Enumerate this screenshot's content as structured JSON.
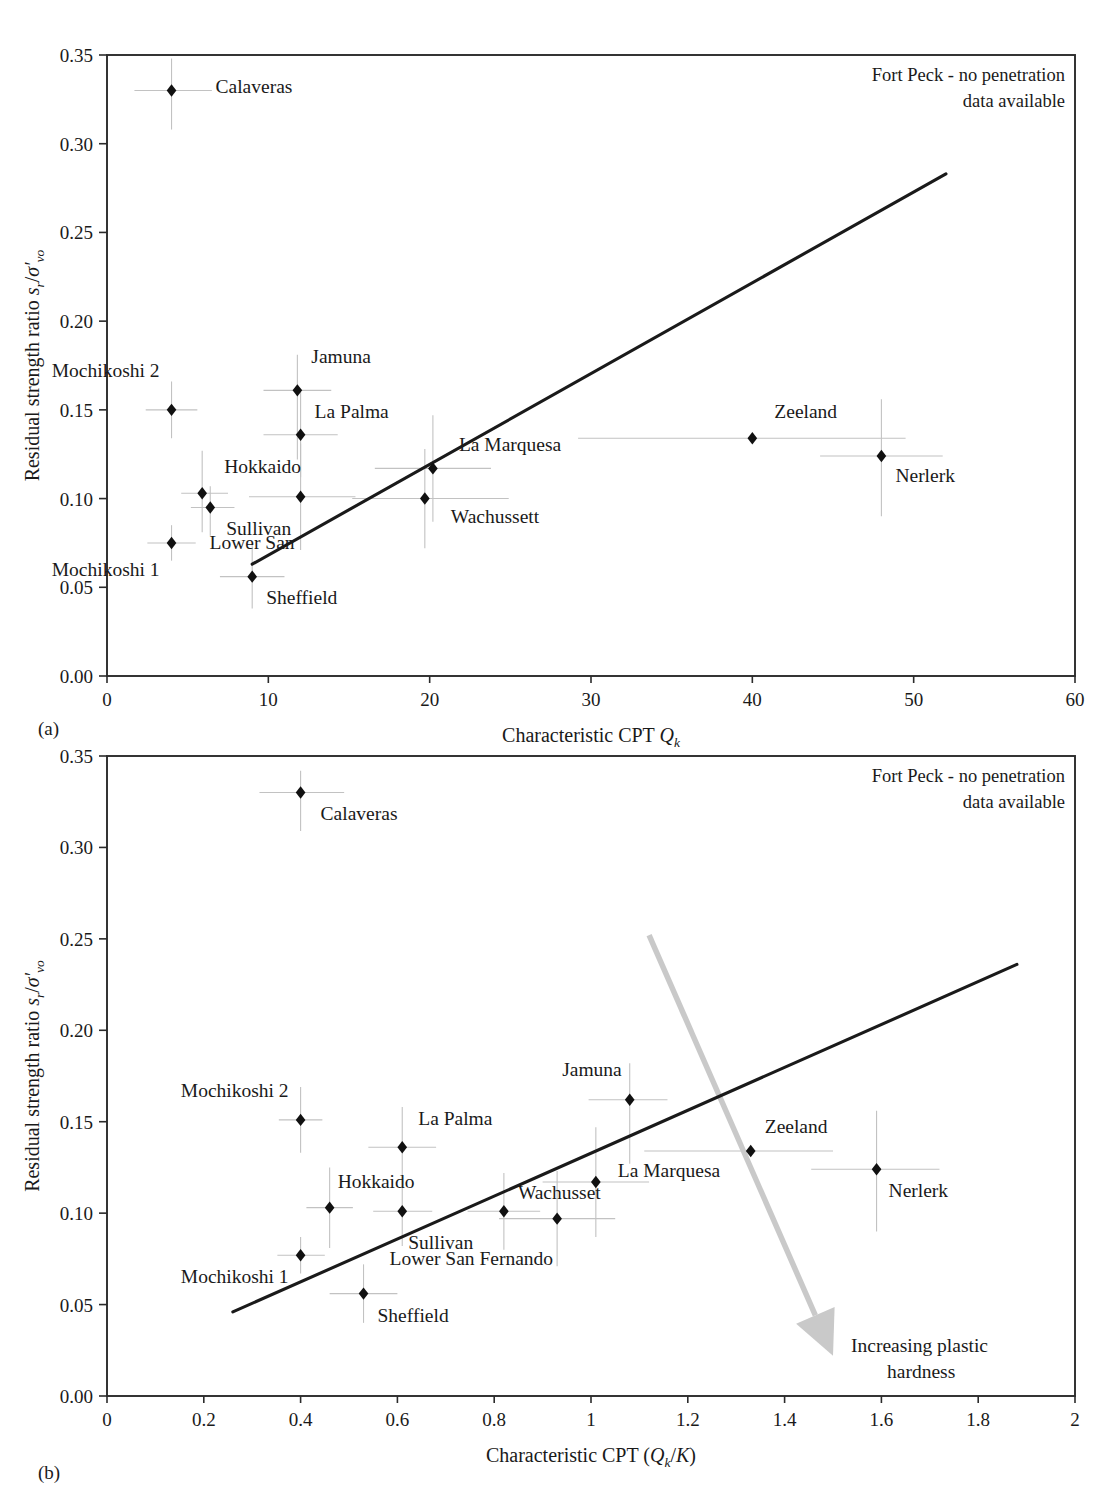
{
  "figure": {
    "panel_a_tag": "(a)",
    "panel_b_tag": "(b)"
  },
  "chart_data": [
    {
      "type": "scatter",
      "panel": "(a)",
      "title": "",
      "xlabel": "Characteristic CPT Q_k",
      "xlabel_parts": {
        "main": "Characteristic CPT ",
        "italic": "Q",
        "sub": "k"
      },
      "ylabel": "Residual strength ratio s_r/σ'_vo",
      "ylabel_parts": {
        "main": "Residual strength ratio ",
        "s": "s",
        "s_sub": "r",
        "slash": "/",
        "sigma": "σ′",
        "sigma_sub": "vo"
      },
      "xlim": [
        0,
        60
      ],
      "ylim": [
        0.0,
        0.35
      ],
      "xticks": [
        0,
        10,
        20,
        30,
        40,
        50,
        60
      ],
      "xticklabels": [
        "0",
        "10",
        "20",
        "30",
        "40",
        "50",
        "60"
      ],
      "yticks": [
        0.0,
        0.05,
        0.1,
        0.15,
        0.2,
        0.25,
        0.3,
        0.35
      ],
      "yticklabels": [
        "0.00",
        "0.05",
        "0.10",
        "0.15",
        "0.20",
        "0.25",
        "0.30",
        "0.35"
      ],
      "grid": false,
      "legend": "none",
      "annotation": "Fort Peck - no penetration data available",
      "annotation_lines": [
        "Fort Peck - no penetration",
        "data available"
      ],
      "trendline": {
        "x": [
          9.0,
          52.0
        ],
        "y": [
          0.063,
          0.283
        ]
      },
      "points": [
        {
          "label": "Calaveras",
          "x": 4.0,
          "y": 0.33,
          "xerr": [
            2.3,
            2.5
          ],
          "yerr": [
            0.022,
            0.018
          ],
          "label_dx": 44,
          "label_dy": 3
        },
        {
          "label": "Mochikoshi 2",
          "x": 4.0,
          "y": 0.15,
          "xerr": [
            1.6,
            1.6
          ],
          "yerr": [
            0.016,
            0.016
          ],
          "label_dx": -12,
          "label_dy": -33
        },
        {
          "label": "Jamuna",
          "x": 11.8,
          "y": 0.161,
          "xerr": [
            2.1,
            2.1
          ],
          "yerr": [
            0.039,
            0.02
          ],
          "label_dx": 14,
          "label_dy": -27
        },
        {
          "label": "La Palma",
          "x": 12.0,
          "y": 0.136,
          "xerr": [
            2.3,
            2.3
          ],
          "yerr": [
            0.024,
            0.024
          ],
          "label_dx": 14,
          "label_dy": -17
        },
        {
          "label": "La Marquesa",
          "x": 20.2,
          "y": 0.117,
          "xerr": [
            3.6,
            3.6
          ],
          "yerr": [
            0.03,
            0.03
          ],
          "label_dx": 26,
          "label_dy": -17
        },
        {
          "label": "Hokkaido",
          "x": 5.9,
          "y": 0.103,
          "xerr": [
            1.3,
            1.6
          ],
          "yerr": [
            0.022,
            0.024
          ],
          "label_dx": 22,
          "label_dy": -20
        },
        {
          "label": "Sullivan",
          "x": 6.4,
          "y": 0.095,
          "xerr": [
            1.2,
            1.5
          ],
          "yerr": [
            0.016,
            0.012
          ],
          "label_dx": 16,
          "label_dy": 28
        },
        {
          "label": "Lower San",
          "x": 12.0,
          "y": 0.101,
          "xerr": [
            3.2,
            3.4
          ],
          "yerr": [
            0.03,
            0.03
          ],
          "label_dx": -6,
          "label_dy": 52
        },
        {
          "label": "Wachussett",
          "x": 19.7,
          "y": 0.1,
          "xerr": [
            4.5,
            5.2
          ],
          "yerr": [
            0.028,
            0.028
          ],
          "label_dx": 26,
          "label_dy": 24
        },
        {
          "label": "Mochikoshi 1",
          "x": 4.0,
          "y": 0.075,
          "xerr": [
            1.5,
            1.5
          ],
          "yerr": [
            0.01,
            0.01
          ],
          "label_dx": -12,
          "label_dy": 33
        },
        {
          "label": "Sheffield",
          "x": 9.0,
          "y": 0.056,
          "xerr": [
            2.0,
            2.0
          ],
          "yerr": [
            0.018,
            0.018
          ],
          "label_dx": 14,
          "label_dy": 27
        },
        {
          "label": "Zeeland",
          "x": 40.0,
          "y": 0.134,
          "xerr": [
            10.8,
            9.5
          ],
          "yerr": [
            0.0,
            0.0
          ],
          "label_dx": 22,
          "label_dy": -20
        },
        {
          "label": "Nerlerk",
          "x": 48.0,
          "y": 0.124,
          "xerr": [
            3.8,
            3.8
          ],
          "yerr": [
            0.034,
            0.032
          ],
          "label_dx": 14,
          "label_dy": 26
        }
      ]
    },
    {
      "type": "scatter",
      "panel": "(b)",
      "title": "",
      "xlabel": "Characteristic CPT (Q_k/K)",
      "xlabel_parts": {
        "main": "Characteristic CPT (",
        "italic": "Q",
        "sub": "k",
        "mid": "/",
        "italic2": "K",
        "close": ")"
      },
      "ylabel": "Residual strength ratio s_r/σ'_vo",
      "ylabel_parts": {
        "main": "Residual strength ratio ",
        "s": "s",
        "s_sub": "r",
        "slash": "/",
        "sigma": "σ′",
        "sigma_sub": "vo"
      },
      "xlim": [
        0,
        2
      ],
      "ylim": [
        0.0,
        0.35
      ],
      "xticks": [
        0,
        0.2,
        0.4,
        0.6,
        0.8,
        1.0,
        1.2,
        1.4,
        1.6,
        1.8,
        2.0
      ],
      "xticklabels": [
        "0",
        "0.2",
        "0.4",
        "0.6",
        "0.8",
        "1",
        "1.2",
        "1.4",
        "1.6",
        "1.8",
        "2"
      ],
      "yticks": [
        0.0,
        0.05,
        0.1,
        0.15,
        0.2,
        0.25,
        0.3,
        0.35
      ],
      "yticklabels": [
        "0.00",
        "0.05",
        "0.10",
        "0.15",
        "0.20",
        "0.25",
        "0.30",
        "0.35"
      ],
      "grid": false,
      "legend": "none",
      "annotation": "Fort Peck - no penetration data available",
      "annotation_lines": [
        "Fort Peck - no penetration",
        "data available"
      ],
      "trendline": {
        "x": [
          0.26,
          1.88
        ],
        "y": [
          0.046,
          0.236
        ]
      },
      "arrow": {
        "label": "Increasing plastic hardness",
        "label_lines": [
          "Increasing plastic",
          "hardness"
        ],
        "from": {
          "x": 1.12,
          "y": 0.252
        },
        "to": {
          "x": 1.5,
          "y": 0.022
        },
        "color": "#c9c9c9"
      },
      "points": [
        {
          "label": "Calaveras",
          "x": 0.4,
          "y": 0.33,
          "xerr": [
            0.085,
            0.09
          ],
          "yerr": [
            0.021,
            0.012
          ],
          "label_dx": 20,
          "label_dy": 27
        },
        {
          "label": "Mochikoshi 2",
          "x": 0.4,
          "y": 0.151,
          "xerr": [
            0.045,
            0.045
          ],
          "yerr": [
            0.018,
            0.018
          ],
          "label_dx": -12,
          "label_dy": -23
        },
        {
          "label": "Jamuna",
          "x": 1.08,
          "y": 0.162,
          "xerr": [
            0.085,
            0.078
          ],
          "yerr": [
            0.035,
            0.02
          ],
          "label_dx": -8,
          "label_dy": -24
        },
        {
          "label": "La Palma",
          "x": 0.61,
          "y": 0.136,
          "xerr": [
            0.07,
            0.07
          ],
          "yerr": [
            0.022,
            0.022
          ],
          "label_dx": 16,
          "label_dy": -22
        },
        {
          "label": "La Marquesa",
          "x": 1.01,
          "y": 0.117,
          "xerr": [
            0.11,
            0.11
          ],
          "yerr": [
            0.03,
            0.03
          ],
          "label_dx": 22,
          "label_dy": -5
        },
        {
          "label": "Hokkaido",
          "x": 0.46,
          "y": 0.103,
          "xerr": [
            0.048,
            0.048
          ],
          "yerr": [
            0.022,
            0.022
          ],
          "label_dx": 8,
          "label_dy": -20
        },
        {
          "label": "Sullivan",
          "x": 0.61,
          "y": 0.101,
          "xerr": [
            0.06,
            0.062
          ],
          "yerr": [
            0.019,
            0.018
          ],
          "label_dx": 6,
          "label_dy": 38
        },
        {
          "label": "Wachusset",
          "x": 0.82,
          "y": 0.101,
          "xerr": [
            0.075,
            0.075
          ],
          "yerr": [
            0.021,
            0.021
          ],
          "label_dx": 14,
          "label_dy": -12
        },
        {
          "label": "Lower San Fernando",
          "x": 0.93,
          "y": 0.097,
          "xerr": [
            0.12,
            0.12
          ],
          "yerr": [
            0.026,
            0.026
          ],
          "label_dx": -4,
          "label_dy": 46
        },
        {
          "label": "Mochikoshi 1",
          "x": 0.4,
          "y": 0.077,
          "xerr": [
            0.048,
            0.05
          ],
          "yerr": [
            0.01,
            0.01
          ],
          "label_dx": -12,
          "label_dy": 28
        },
        {
          "label": "Sheffield",
          "x": 0.53,
          "y": 0.056,
          "xerr": [
            0.07,
            0.07
          ],
          "yerr": [
            0.016,
            0.016
          ],
          "label_dx": 14,
          "label_dy": 28
        },
        {
          "label": "Zeeland",
          "x": 1.33,
          "y": 0.134,
          "xerr": [
            0.22,
            0.17
          ],
          "yerr": [
            0.0,
            0.0
          ],
          "label_dx": 14,
          "label_dy": -18
        },
        {
          "label": "Nerlerk",
          "x": 1.59,
          "y": 0.124,
          "xerr": [
            0.135,
            0.13
          ],
          "yerr": [
            0.034,
            0.032
          ],
          "label_dx": 12,
          "label_dy": 28
        }
      ]
    }
  ]
}
